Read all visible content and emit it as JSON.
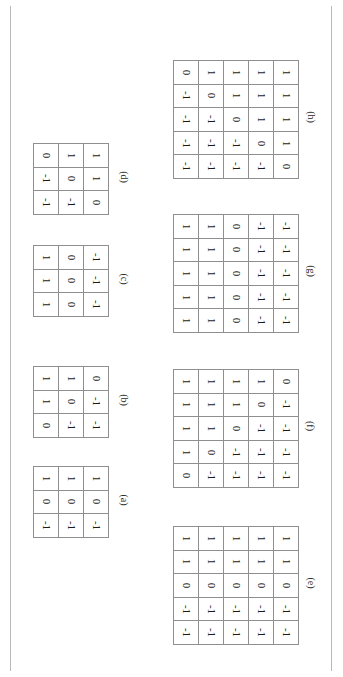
{
  "page": {
    "orientation": "rotated-90-clockwise",
    "background_color": "#ffffff",
    "rule_color": "#b9b9b9",
    "grid_line_color": "#8f8f8f",
    "text_color": "#1a1a1a"
  },
  "figure": {
    "matrices": [
      {
        "id": "a",
        "caption": "(a)",
        "size": "3x3",
        "rows": 3,
        "cols": 3,
        "values": [
          [
            "1",
            "1",
            "1"
          ],
          [
            "0",
            "0",
            "0"
          ],
          [
            "-1",
            "-1",
            "-1"
          ]
        ]
      },
      {
        "id": "b",
        "caption": "(b)",
        "size": "3x3",
        "rows": 3,
        "cols": 3,
        "values": [
          [
            "1",
            "1",
            "0"
          ],
          [
            "1",
            "0",
            "-1"
          ],
          [
            "0",
            "-1",
            "-1"
          ]
        ]
      },
      {
        "id": "c",
        "caption": "(c)",
        "size": "3x3",
        "rows": 3,
        "cols": 3,
        "values": [
          [
            "1",
            "0",
            "-1"
          ],
          [
            "1",
            "0",
            "-1"
          ],
          [
            "1",
            "0",
            "-1"
          ]
        ]
      },
      {
        "id": "d",
        "caption": "(d)",
        "size": "3x3",
        "rows": 3,
        "cols": 3,
        "values": [
          [
            "0",
            "1",
            "1"
          ],
          [
            "-1",
            "0",
            "1"
          ],
          [
            "-1",
            "-1",
            "0"
          ]
        ]
      },
      {
        "id": "e",
        "caption": "(e)",
        "size": "5x5",
        "rows": 5,
        "cols": 5,
        "values": [
          [
            "1",
            "1",
            "1",
            "1",
            "1"
          ],
          [
            "1",
            "1",
            "1",
            "1",
            "1"
          ],
          [
            "0",
            "0",
            "0",
            "0",
            "0"
          ],
          [
            "-1",
            "-1",
            "-1",
            "-1",
            "-1"
          ],
          [
            "-1",
            "-1",
            "-1",
            "-1",
            "-1"
          ]
        ]
      },
      {
        "id": "f",
        "caption": "(f)",
        "size": "5x5",
        "rows": 5,
        "cols": 5,
        "values": [
          [
            "1",
            "1",
            "1",
            "1",
            "0"
          ],
          [
            "1",
            "1",
            "1",
            "0",
            "-1"
          ],
          [
            "1",
            "1",
            "0",
            "-1",
            "-1"
          ],
          [
            "1",
            "0",
            "-1",
            "-1",
            "-1"
          ],
          [
            "0",
            "-1",
            "-1",
            "-1",
            "-1"
          ]
        ]
      },
      {
        "id": "g",
        "caption": "(g)",
        "size": "5x5",
        "rows": 5,
        "cols": 5,
        "values": [
          [
            "1",
            "1",
            "0",
            "-1",
            "-1"
          ],
          [
            "1",
            "1",
            "0",
            "-1",
            "-1"
          ],
          [
            "1",
            "1",
            "0",
            "-1",
            "-1"
          ],
          [
            "1",
            "1",
            "0",
            "-1",
            "-1"
          ],
          [
            "1",
            "1",
            "0",
            "-1",
            "-1"
          ]
        ]
      },
      {
        "id": "h",
        "caption": "(h)",
        "size": "5x5",
        "rows": 5,
        "cols": 5,
        "values": [
          [
            "0",
            "1",
            "1",
            "1",
            "1"
          ],
          [
            "-1",
            "0",
            "1",
            "1",
            "1"
          ],
          [
            "-1",
            "-1",
            "0",
            "1",
            "1"
          ],
          [
            "-1",
            "-1",
            "-1",
            "0",
            "1"
          ],
          [
            "-1",
            "-1",
            "-1",
            "-1",
            "0"
          ]
        ]
      }
    ]
  },
  "layout": {
    "blocks": [
      {
        "id": "d",
        "left": 33,
        "top": 143,
        "cap_left": 118,
        "cap_top": 172
      },
      {
        "id": "c",
        "left": 33,
        "top": 245,
        "cap_left": 118,
        "cap_top": 274
      },
      {
        "id": "b",
        "left": 33,
        "top": 366,
        "cap_left": 118,
        "cap_top": 395
      },
      {
        "id": "a",
        "left": 33,
        "top": 466,
        "cap_left": 118,
        "cap_top": 495
      },
      {
        "id": "h",
        "left": 173,
        "top": 60,
        "cap_left": 305,
        "cap_top": 112
      },
      {
        "id": "g",
        "left": 173,
        "top": 214,
        "cap_left": 305,
        "cap_top": 266
      },
      {
        "id": "f",
        "left": 173,
        "top": 369,
        "cap_left": 305,
        "cap_top": 421
      },
      {
        "id": "e",
        "left": 173,
        "top": 526,
        "cap_left": 305,
        "cap_top": 578
      }
    ]
  }
}
